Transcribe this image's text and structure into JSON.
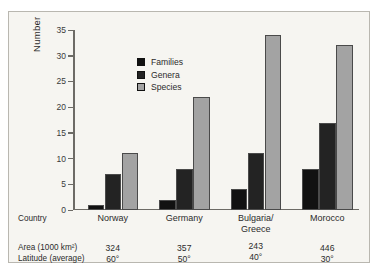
{
  "chart_data": {
    "type": "bar",
    "title": "",
    "xlabel": "",
    "ylabel": "Number",
    "ylim": [
      0,
      35
    ],
    "yticks": [
      0,
      5,
      10,
      15,
      20,
      25,
      30,
      35
    ],
    "grid": false,
    "legend_position": "upper-left-inside",
    "categories": [
      "Norway",
      "Germany",
      "Bulgaria/\nGreece",
      "Morocco"
    ],
    "series": [
      {
        "name": "Families",
        "color": "#111111",
        "values": [
          1,
          2,
          4,
          8
        ]
      },
      {
        "name": "Genera",
        "color": "#232323",
        "values": [
          7,
          8,
          11,
          17
        ]
      },
      {
        "name": "Species",
        "color": "#a3a3a3",
        "values": [
          11,
          22,
          34,
          32
        ]
      }
    ],
    "annotations": {
      "row_labels": [
        "Country",
        "Area (1000 km²)",
        "Latitude (average)"
      ],
      "country_lines": [
        [
          "Norway"
        ],
        [
          "Germany"
        ],
        [
          "Bulgaria/",
          "Greece"
        ],
        [
          "Morocco"
        ]
      ],
      "area": [
        "324",
        "357",
        "243",
        "446"
      ],
      "latitude": [
        "60°",
        "50°",
        "40°",
        "30°"
      ]
    }
  },
  "axis": {
    "y_title": "Number",
    "tick_labels": [
      "35",
      "30",
      "25",
      "20",
      "15",
      "10",
      "5",
      "0"
    ]
  },
  "legend": {
    "items": [
      {
        "label": "Families",
        "color": "#111111"
      },
      {
        "label": "Genera",
        "color": "#232323"
      },
      {
        "label": "Species",
        "color": "#a3a3a3"
      }
    ]
  },
  "table": {
    "label_country": "Country",
    "label_area": "Area (1000 km²)",
    "label_latitude": "Latitude (average)",
    "countries": [
      "Norway",
      "Germany",
      "Bulgaria/",
      "Morocco"
    ],
    "country_second_line": "Greece",
    "areas": [
      "324",
      "357",
      "243",
      "446"
    ],
    "latitudes": [
      "60°",
      "50°",
      "40°",
      "30°"
    ]
  },
  "style": {
    "background": "#f6f5f1",
    "border": "#b9b7b0",
    "axis": "#6d6b66",
    "bar_outline": "#4a4a4a"
  }
}
